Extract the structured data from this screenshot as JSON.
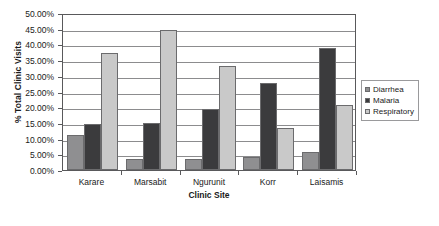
{
  "chart_data": {
    "type": "bar",
    "title": "",
    "xlabel": "Clinic Site",
    "ylabel": "% Total Clinic Visits",
    "categories": [
      "Karare",
      "Marsabit",
      "Ngurunit",
      "Korr",
      "Laisamis"
    ],
    "series": [
      {
        "name": "Diarrhea",
        "color": "#8f8f91",
        "values": [
          11.1,
          3.5,
          3.45,
          4.15,
          5.8
        ]
      },
      {
        "name": "Malaria",
        "color": "#3b3b3d",
        "values": [
          14.7,
          15.1,
          19.4,
          27.6,
          38.8
        ]
      },
      {
        "name": "Respiratory",
        "color": "#c9c9c9",
        "values": [
          37.3,
          44.6,
          33.1,
          13.4,
          20.6
        ]
      }
    ],
    "ylim": [
      0,
      50
    ],
    "ytick_step": 5,
    "ytick_labels": [
      "0.00%",
      "5.00%",
      "10.00%",
      "15.00%",
      "20.00%",
      "25.00%",
      "30.00%",
      "35.00%",
      "40.00%",
      "45.00%",
      "50.00%"
    ],
    "ytick_values": [
      0,
      5,
      10,
      15,
      20,
      25,
      30,
      35,
      40,
      45,
      50
    ],
    "grid": true,
    "legend_position": "right",
    "legend_entries": [
      "Diarrhea",
      "Malaria",
      "Respiratory"
    ]
  }
}
